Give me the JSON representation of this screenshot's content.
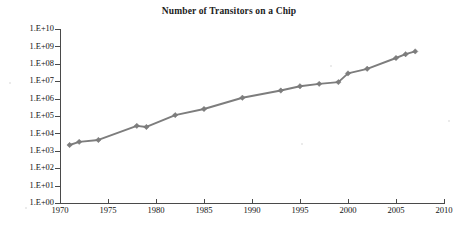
{
  "chart_data": {
    "type": "line",
    "title": "Number of Transitors on a Chip",
    "xlabel": "",
    "ylabel": "",
    "yscale": "log",
    "xlim": [
      1970,
      2010
    ],
    "ylim": [
      1,
      10000000000
    ],
    "grid": false,
    "legend": null,
    "xticks": [
      1970,
      1975,
      1980,
      1985,
      1990,
      1995,
      2000,
      2005,
      2010
    ],
    "xtick_labels": [
      "1970",
      "1975",
      "1980",
      "1985",
      "1990",
      "1995",
      "2000",
      "2005",
      "2010"
    ],
    "yticks": [
      1,
      10,
      100,
      1000,
      10000,
      100000,
      1000000,
      10000000,
      100000000,
      1000000000,
      10000000000
    ],
    "ytick_labels": [
      "1.E+00",
      "1.E+01",
      "1.E+02",
      "1.E+03",
      "1.E+04",
      "1.E+05",
      "1.E+06",
      "1.E+07",
      "1.E+08",
      "1.E+09",
      "1.E+10"
    ],
    "series_color": "#7d7d7d",
    "axis_color": "#4a4a4a",
    "x": [
      1971,
      1972,
      1974,
      1978,
      1979,
      1982,
      1985,
      1989,
      1993,
      1995,
      1997,
      1999,
      2000,
      2002,
      2005,
      2006,
      2007
    ],
    "y": [
      2300,
      3500,
      4500,
      29000,
      25000,
      120000,
      270000,
      1200000,
      3100000,
      5500000,
      7500000,
      9500000,
      30000000,
      55000000,
      230000000,
      380000000,
      550000000
    ],
    "points": [
      {
        "year": 1971,
        "transistors": 2300
      },
      {
        "year": 1972,
        "transistors": 3500
      },
      {
        "year": 1974,
        "transistors": 4500
      },
      {
        "year": 1978,
        "transistors": 29000
      },
      {
        "year": 1979,
        "transistors": 25000
      },
      {
        "year": 1982,
        "transistors": 120000
      },
      {
        "year": 1985,
        "transistors": 270000
      },
      {
        "year": 1989,
        "transistors": 1200000
      },
      {
        "year": 1993,
        "transistors": 3100000
      },
      {
        "year": 1995,
        "transistors": 5500000
      },
      {
        "year": 1997,
        "transistors": 7500000
      },
      {
        "year": 1999,
        "transistors": 9500000
      },
      {
        "year": 2000,
        "transistors": 30000000
      },
      {
        "year": 2002,
        "transistors": 55000000
      },
      {
        "year": 2005,
        "transistors": 230000000
      },
      {
        "year": 2006,
        "transistors": 380000000
      },
      {
        "year": 2007,
        "transistors": 550000000
      }
    ]
  }
}
